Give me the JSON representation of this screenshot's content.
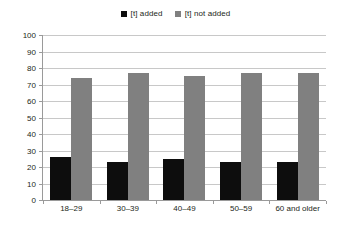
{
  "chart_data": {
    "type": "bar",
    "title": "",
    "subtitle": "",
    "xlabel": "",
    "ylabel": "",
    "ylim": [
      0,
      100
    ],
    "ytick_step": 10,
    "yticks": [
      "100",
      "90",
      "80",
      "70",
      "60",
      "50",
      "40",
      "30",
      "20",
      "10",
      "0"
    ],
    "grid": true,
    "legend_position": "top-center",
    "categories": [
      "18–29",
      "30–39",
      "40–49",
      "50–59",
      "60 and older"
    ],
    "series": [
      {
        "name": "[t] added",
        "color": "#0d0d0d",
        "values": [
          26,
          23,
          25,
          23,
          23
        ]
      },
      {
        "name": "[t] not added",
        "color": "#808080",
        "values": [
          74,
          77,
          75,
          77,
          77
        ]
      }
    ]
  },
  "legend": {
    "items": [
      {
        "label": "[t] added",
        "swatch": "black-square-swatch"
      },
      {
        "label": "[t] not added",
        "swatch": "gray-square-swatch"
      }
    ]
  },
  "colors": {
    "series_added": "#0d0d0d",
    "series_not_added": "#808080",
    "gridline": "#c8c8c8",
    "axis": "#9a9a9a",
    "text": "#231f20",
    "background": "#ffffff"
  }
}
